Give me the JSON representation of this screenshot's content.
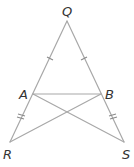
{
  "diagram": {
    "type": "geometry",
    "points": {
      "Q": {
        "label": "Q",
        "x": 67,
        "y": 21
      },
      "A": {
        "label": "A",
        "x": 33,
        "y": 94
      },
      "B": {
        "label": "B",
        "x": 101,
        "y": 94
      },
      "R": {
        "label": "R",
        "x": 10,
        "y": 142
      },
      "S": {
        "label": "S",
        "x": 124,
        "y": 142
      }
    },
    "segments": [
      [
        "Q",
        "R"
      ],
      [
        "Q",
        "S"
      ],
      [
        "A",
        "B"
      ],
      [
        "A",
        "S"
      ],
      [
        "B",
        "R"
      ]
    ],
    "congruence_marks": [
      {
        "segment": [
          "Q",
          "A"
        ],
        "ticks": 1
      },
      {
        "segment": [
          "Q",
          "B"
        ],
        "ticks": 1
      },
      {
        "segment": [
          "A",
          "R"
        ],
        "ticks": 2
      },
      {
        "segment": [
          "B",
          "S"
        ],
        "ticks": 2
      }
    ]
  }
}
